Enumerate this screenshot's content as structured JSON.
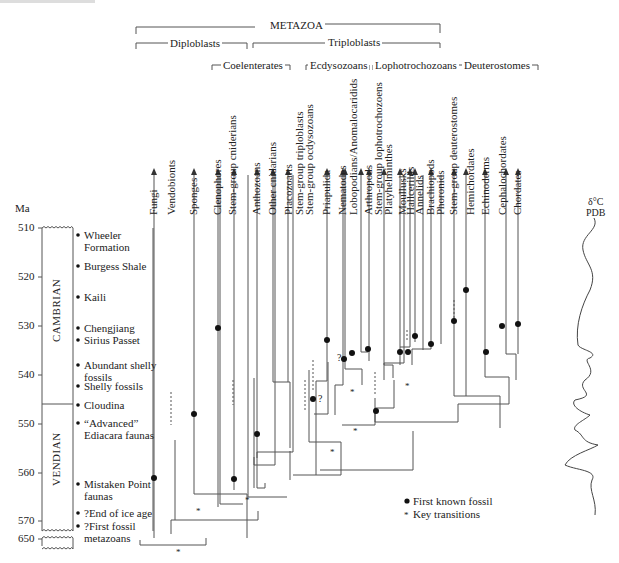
{
  "clade_headers": {
    "metazoa": "METAZOA",
    "diploblasts": "Diploblasts",
    "triploblasts": "Triploblasts",
    "coelenterates": "Coelenterates",
    "ecdysozoans": "Ecdysozoans",
    "lophotrochozoans": "Lophotrochozoans",
    "deuterostomes": "Deuterostomes"
  },
  "taxa": [
    "Fungi",
    "Vendobionts",
    "Sponges",
    "Clenophores",
    "Stem-group cniderians",
    "Anthozoans",
    "Other cnidarians",
    "Placozoarts",
    "Stem-group triploblasts",
    "Stem-group ocdysozoans",
    "Priapulida",
    "Nematodes",
    "Lobopodians/Anomalocaridids",
    "Arthropods",
    "Stem-group lophotrochozoens",
    "Platyhelminthes",
    "Moullusks",
    "Hallcerilds",
    "Annelids",
    "Brachiopods",
    "Phoronids",
    "Stem-group deuterostomes",
    "Hemichordates",
    "Echinoderms",
    "Cephalochordates",
    "Chordates"
  ],
  "time_axis": {
    "unit": "Ma",
    "ticks": [
      "510",
      "520",
      "530",
      "540",
      "550",
      "560",
      "570",
      "650"
    ]
  },
  "periods": [
    "CAMBRIAN",
    "VENDIAN"
  ],
  "events": [
    {
      "label1": "Wheeler",
      "label2": "Formation"
    },
    {
      "label1": "Burgess Shale",
      "label2": ""
    },
    {
      "label1": "Kaili",
      "label2": ""
    },
    {
      "label1": "Chengjiang",
      "label2": ""
    },
    {
      "label1": "Sirius Passet",
      "label2": ""
    },
    {
      "label1": "Abundant shelly",
      "label2": "fossils"
    },
    {
      "label1": "Shelly fossils",
      "label2": ""
    },
    {
      "label1": "Cloudina",
      "label2": ""
    },
    {
      "label1": "“Advanced”",
      "label2": "Ediacara faunas"
    },
    {
      "label1": "Mistaken Point",
      "label2": "faunas"
    },
    {
      "label1": "?End of ice age",
      "label2": ""
    },
    {
      "label1": "?First fossil",
      "label2": "metazoans"
    }
  ],
  "isotope_curve": {
    "label1": "δ°C",
    "label2": "PDB"
  },
  "legend": {
    "first_fossil": "First known fossil",
    "key_transitions": "Key transitions"
  },
  "annotations": {
    "question": "?"
  }
}
